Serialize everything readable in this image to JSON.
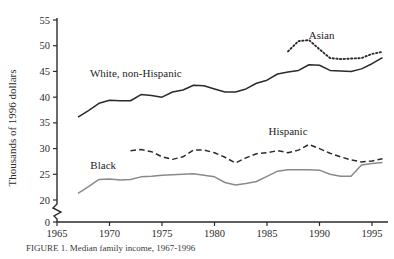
{
  "chart_data": {
    "type": "line",
    "title": "",
    "xlabel": "",
    "ylabel": "Thousands of 1996 dollars",
    "xlim": [
      1965,
      1996.5
    ],
    "ylim": [
      18.5,
      56
    ],
    "yticks": [
      0,
      20,
      25,
      30,
      35,
      40,
      45,
      50,
      55
    ],
    "ytick_labels": [
      "0",
      "20",
      "25",
      "30",
      "35",
      "40",
      "45",
      "50",
      "55"
    ],
    "xticks": [
      1965,
      1970,
      1975,
      1980,
      1985,
      1990,
      1995
    ],
    "xtick_labels": [
      "1965",
      "1970",
      "1975",
      "1980",
      "1985",
      "1990",
      "1995"
    ],
    "axis_break": true,
    "grid": false,
    "legend": "inline-labels",
    "series": [
      {
        "name": "White, non-Hispanic",
        "style": "solid",
        "color": "#2b2b2b",
        "label_x": 1972.5,
        "label_y": 44.0,
        "x": [
          1967,
          1968,
          1969,
          1970,
          1971,
          1972,
          1973,
          1974,
          1975,
          1976,
          1977,
          1978,
          1979,
          1980,
          1981,
          1982,
          1983,
          1984,
          1985,
          1986,
          1987,
          1988,
          1989,
          1990,
          1991,
          1992,
          1993,
          1994,
          1995,
          1996
        ],
        "values": [
          36.1,
          37.4,
          38.8,
          39.4,
          39.3,
          39.3,
          40.5,
          40.3,
          40.0,
          41.0,
          41.4,
          42.3,
          42.2,
          41.6,
          41.0,
          41.0,
          41.6,
          42.7,
          43.3,
          44.5,
          44.9,
          45.2,
          46.3,
          46.2,
          45.2,
          45.1,
          45.0,
          45.5,
          46.5,
          47.7
        ]
      },
      {
        "name": "Asian",
        "style": "dotted",
        "color": "#2b2b2b",
        "label_x": 1990.2,
        "label_y": 51.3,
        "x": [
          1987,
          1988,
          1989,
          1990,
          1991,
          1992,
          1993,
          1994,
          1995,
          1996
        ],
        "values": [
          48.9,
          50.9,
          51.1,
          49.3,
          47.6,
          47.4,
          47.5,
          47.6,
          48.4,
          48.8
        ]
      },
      {
        "name": "Hispanic",
        "style": "dashed",
        "color": "#2b2b2b",
        "label_x": 1987.0,
        "label_y": 32.6,
        "x": [
          1972,
          1973,
          1974,
          1975,
          1976,
          1977,
          1978,
          1979,
          1980,
          1981,
          1982,
          1983,
          1984,
          1985,
          1986,
          1987,
          1988,
          1989,
          1990,
          1991,
          1992,
          1993,
          1994,
          1995,
          1996
        ],
        "values": [
          29.6,
          29.8,
          29.4,
          28.4,
          27.9,
          28.4,
          29.7,
          29.7,
          29.2,
          28.3,
          27.2,
          28.2,
          29.0,
          29.2,
          29.6,
          29.2,
          29.7,
          30.8,
          30.0,
          29.1,
          28.4,
          27.8,
          27.4,
          27.6,
          28.0
        ]
      },
      {
        "name": "Black",
        "style": "solid",
        "color": "#8a8a8a",
        "label_x": 1969.4,
        "label_y": 26.1,
        "x": [
          1967,
          1968,
          1969,
          1970,
          1971,
          1972,
          1973,
          1974,
          1975,
          1976,
          1977,
          1978,
          1979,
          1980,
          1981,
          1982,
          1983,
          1984,
          1985,
          1986,
          1987,
          1988,
          1989,
          1990,
          1991,
          1992,
          1993,
          1994,
          1995,
          1996
        ],
        "values": [
          21.3,
          22.6,
          24.0,
          24.1,
          23.9,
          24.0,
          24.5,
          24.6,
          24.8,
          24.9,
          25.0,
          25.1,
          24.8,
          24.5,
          23.4,
          22.9,
          23.2,
          23.6,
          24.6,
          25.6,
          25.9,
          25.9,
          25.9,
          25.8,
          25.0,
          24.6,
          24.6,
          26.8,
          27.1,
          27.3
        ]
      }
    ],
    "caption": "FIGURE 1. Median family income, 1967-1996"
  }
}
